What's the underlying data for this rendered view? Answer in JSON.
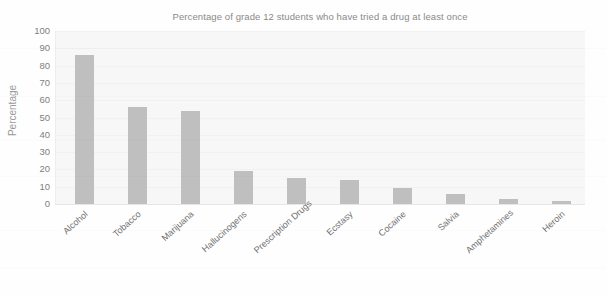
{
  "chart_data": {
    "type": "bar",
    "title": "Percentage of grade 12 students who have tried a drug at least once",
    "xlabel": "",
    "ylabel": "Percentage",
    "ylim": [
      0,
      100
    ],
    "yticks": [
      100,
      90,
      80,
      70,
      60,
      50,
      40,
      30,
      20,
      10,
      0
    ],
    "grid": true,
    "legend": null,
    "bar_color": "#bfbfbf",
    "plot_background": "#f7f7f7",
    "categories": [
      "Alcohol",
      "Tobacco",
      "Marijuana",
      "Hallucinogens",
      "Prescription Drugs",
      "Ecstasy",
      "Cocaine",
      "Salvia",
      "Amphetamines",
      "Heroin"
    ],
    "values": [
      86,
      56,
      54,
      19,
      15,
      14,
      9,
      6,
      3,
      2
    ]
  }
}
